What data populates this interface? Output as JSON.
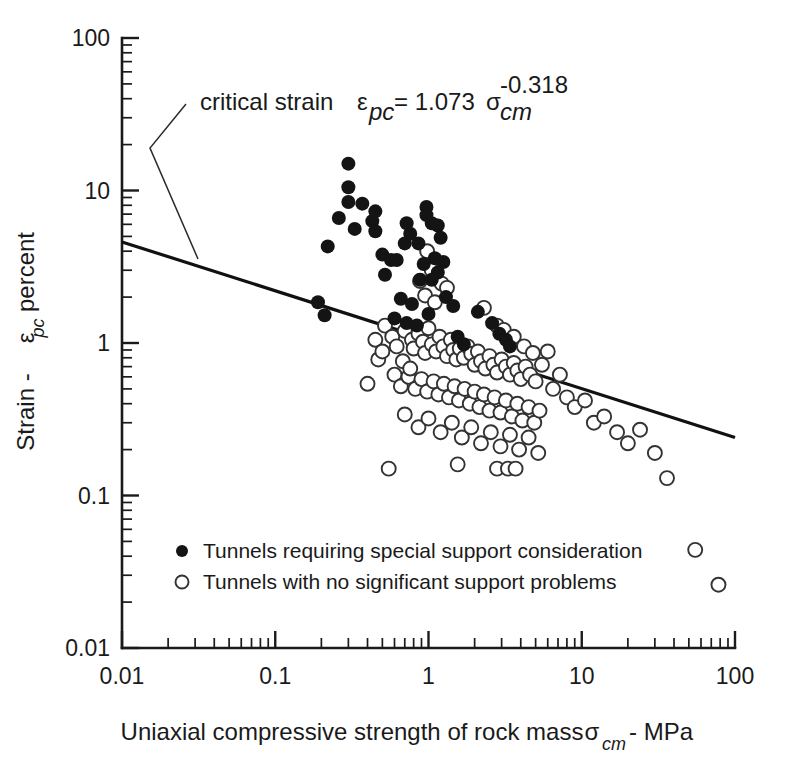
{
  "chart_data": {
    "type": "scatter",
    "title": "",
    "xlabel": "Uniaxial compressive strength of rock mass  σcm - MPa",
    "ylabel": "Strain - εpc percent",
    "xscale": "log",
    "yscale": "log",
    "xlim": [
      0.01,
      100
    ],
    "ylim": [
      0.01,
      100
    ],
    "grid": false,
    "x_tick_labels": [
      "0.01",
      "0.1",
      "1",
      "10",
      "100"
    ],
    "x_tick_values": [
      0.01,
      0.1,
      1,
      10,
      100
    ],
    "y_tick_labels": [
      "0.01",
      "0.1",
      "1",
      "10",
      "100"
    ],
    "y_tick_values": [
      0.01,
      0.1,
      1,
      10,
      100
    ],
    "legend_position": "lower-left-inside",
    "series": [
      {
        "name": "Tunnels requiring special support consideration",
        "marker": "filled-circle",
        "color": "#141414",
        "points": [
          [
            0.3,
            15.0
          ],
          [
            0.3,
            10.5
          ],
          [
            0.3,
            8.4
          ],
          [
            0.37,
            8.2
          ],
          [
            0.26,
            6.6
          ],
          [
            0.43,
            6.3
          ],
          [
            0.33,
            5.6
          ],
          [
            0.45,
            7.3
          ],
          [
            0.45,
            5.4
          ],
          [
            0.22,
            4.3
          ],
          [
            0.5,
            3.8
          ],
          [
            0.57,
            3.5
          ],
          [
            0.62,
            3.5
          ],
          [
            0.52,
            2.8
          ],
          [
            0.72,
            6.1
          ],
          [
            0.76,
            5.2
          ],
          [
            0.7,
            4.5
          ],
          [
            0.86,
            4.5
          ],
          [
            0.97,
            7.8
          ],
          [
            0.97,
            6.9
          ],
          [
            1.05,
            6.1
          ],
          [
            1.15,
            5.9
          ],
          [
            1.2,
            4.9
          ],
          [
            1.1,
            3.6
          ],
          [
            1.25,
            3.4
          ],
          [
            1.15,
            2.9
          ],
          [
            0.93,
            3.3
          ],
          [
            0.88,
            2.6
          ],
          [
            1.05,
            2.6
          ],
          [
            0.19,
            1.85
          ],
          [
            0.21,
            1.52
          ],
          [
            0.66,
            1.95
          ],
          [
            0.78,
            1.8
          ],
          [
            0.6,
            1.45
          ],
          [
            0.72,
            1.35
          ],
          [
            0.84,
            1.3
          ],
          [
            1.0,
            1.55
          ],
          [
            1.3,
            2.0
          ],
          [
            1.45,
            1.75
          ],
          [
            2.1,
            1.6
          ],
          [
            2.6,
            1.35
          ],
          [
            2.9,
            1.15
          ],
          [
            3.2,
            1.05
          ],
          [
            3.4,
            0.95
          ],
          [
            1.55,
            1.1
          ],
          [
            1.7,
            0.98
          ]
        ]
      },
      {
        "name": "Tunnels with no significant support problems",
        "marker": "open-circle",
        "color": "#ffffff",
        "points": [
          [
            0.88,
            2.55
          ],
          [
            0.95,
            2.05
          ],
          [
            1.1,
            1.85
          ],
          [
            0.52,
            1.3
          ],
          [
            0.58,
            1.1
          ],
          [
            0.62,
            0.95
          ],
          [
            0.47,
            0.78
          ],
          [
            0.4,
            0.54
          ],
          [
            0.7,
            1.2
          ],
          [
            0.78,
            1.05
          ],
          [
            0.8,
            0.92
          ],
          [
            0.86,
            1.15
          ],
          [
            0.92,
            1.02
          ],
          [
            0.95,
            0.86
          ],
          [
            1.0,
            1.25
          ],
          [
            1.05,
            0.98
          ],
          [
            1.12,
            0.88
          ],
          [
            1.18,
            1.1
          ],
          [
            1.25,
            0.95
          ],
          [
            1.32,
            0.82
          ],
          [
            1.4,
            1.05
          ],
          [
            1.45,
            0.9
          ],
          [
            1.52,
            0.78
          ],
          [
            1.6,
            0.92
          ],
          [
            1.7,
            0.8
          ],
          [
            1.8,
            0.95
          ],
          [
            1.9,
            0.85
          ],
          [
            2.0,
            0.72
          ],
          [
            2.1,
            0.88
          ],
          [
            2.2,
            0.76
          ],
          [
            2.35,
            0.68
          ],
          [
            2.5,
            0.82
          ],
          [
            2.65,
            0.72
          ],
          [
            2.8,
            0.64
          ],
          [
            3.0,
            0.78
          ],
          [
            3.2,
            0.7
          ],
          [
            3.4,
            0.62
          ],
          [
            3.6,
            0.74
          ],
          [
            3.8,
            0.66
          ],
          [
            4.0,
            0.58
          ],
          [
            4.3,
            0.7
          ],
          [
            4.6,
            0.62
          ],
          [
            5.0,
            0.56
          ],
          [
            0.6,
            0.62
          ],
          [
            0.66,
            0.52
          ],
          [
            0.74,
            0.6
          ],
          [
            0.82,
            0.5
          ],
          [
            0.9,
            0.58
          ],
          [
            0.98,
            0.48
          ],
          [
            1.08,
            0.56
          ],
          [
            1.16,
            0.46
          ],
          [
            1.26,
            0.54
          ],
          [
            1.36,
            0.44
          ],
          [
            1.48,
            0.52
          ],
          [
            1.58,
            0.42
          ],
          [
            1.72,
            0.5
          ],
          [
            1.86,
            0.4
          ],
          [
            2.0,
            0.48
          ],
          [
            2.15,
            0.38
          ],
          [
            2.3,
            0.46
          ],
          [
            2.5,
            0.36
          ],
          [
            2.7,
            0.44
          ],
          [
            2.95,
            0.35
          ],
          [
            3.2,
            0.42
          ],
          [
            3.5,
            0.33
          ],
          [
            3.8,
            0.4
          ],
          [
            4.1,
            0.31
          ],
          [
            4.5,
            0.38
          ],
          [
            4.9,
            0.3
          ],
          [
            5.3,
            0.36
          ],
          [
            0.7,
            0.34
          ],
          [
            0.86,
            0.28
          ],
          [
            1.0,
            0.32
          ],
          [
            1.2,
            0.26
          ],
          [
            1.42,
            0.3
          ],
          [
            1.65,
            0.24
          ],
          [
            1.9,
            0.28
          ],
          [
            2.2,
            0.22
          ],
          [
            2.55,
            0.26
          ],
          [
            2.95,
            0.21
          ],
          [
            3.4,
            0.25
          ],
          [
            3.9,
            0.2
          ],
          [
            4.5,
            0.24
          ],
          [
            5.2,
            0.19
          ],
          [
            0.55,
            0.15
          ],
          [
            1.55,
            0.16
          ],
          [
            2.8,
            0.15
          ],
          [
            3.3,
            0.15
          ],
          [
            3.7,
            0.15
          ],
          [
            6.0,
            0.88
          ],
          [
            6.5,
            0.5
          ],
          [
            7.2,
            0.62
          ],
          [
            8.0,
            0.44
          ],
          [
            9.0,
            0.38
          ],
          [
            10.5,
            0.42
          ],
          [
            12.0,
            0.3
          ],
          [
            14.0,
            0.33
          ],
          [
            17.0,
            0.26
          ],
          [
            20.0,
            0.22
          ],
          [
            24.0,
            0.27
          ],
          [
            30.0,
            0.19
          ],
          [
            36.0,
            0.13
          ],
          [
            55.0,
            0.044
          ],
          [
            78.0,
            0.026
          ],
          [
            0.98,
            4.0
          ],
          [
            1.05,
            3.0
          ],
          [
            1.22,
            2.45
          ],
          [
            1.32,
            2.3
          ],
          [
            2.3,
            1.7
          ],
          [
            2.8,
            1.3
          ],
          [
            3.1,
            1.22
          ],
          [
            3.6,
            1.1
          ],
          [
            4.2,
            0.95
          ],
          [
            4.8,
            0.86
          ],
          [
            5.5,
            0.72
          ],
          [
            0.45,
            1.05
          ],
          [
            0.5,
            0.88
          ],
          [
            0.68,
            0.76
          ],
          [
            0.76,
            0.68
          ]
        ]
      }
    ],
    "fit_line": {
      "label": "critical strain",
      "equation_lhs": "ε",
      "equation_lhs_sub": "pc",
      "equation_eq": "= 1.073",
      "equation_sigma": "σ",
      "equation_sigma_sub": "cm",
      "equation_exponent": "-0.318",
      "coefficient": 1.073,
      "exponent": -0.318,
      "x_start": 0.01,
      "x_end": 100,
      "y_start": 4.6,
      "y_end": 0.24
    }
  },
  "axes": {
    "x_title_main": "Uniaxial compressive strength of rock mass",
    "x_title_symbol": "σ",
    "x_title_symbol_sub": "cm",
    "x_title_units": "- MPa",
    "y_title_main": "Strain -",
    "y_title_symbol": "ε",
    "y_title_symbol_sub": "pc",
    "y_title_units": "percent"
  },
  "annotation": {
    "label": "critical strain"
  },
  "legend": {
    "items": [
      {
        "marker": "filled-circle",
        "label": "Tunnels requiring special support consideration"
      },
      {
        "marker": "open-circle",
        "label": "Tunnels with no significant support problems"
      }
    ]
  },
  "colors": {
    "ink": "#1a1a1a",
    "marker_filled": "#141414",
    "marker_open_stroke": "#333333",
    "background": "#ffffff"
  }
}
